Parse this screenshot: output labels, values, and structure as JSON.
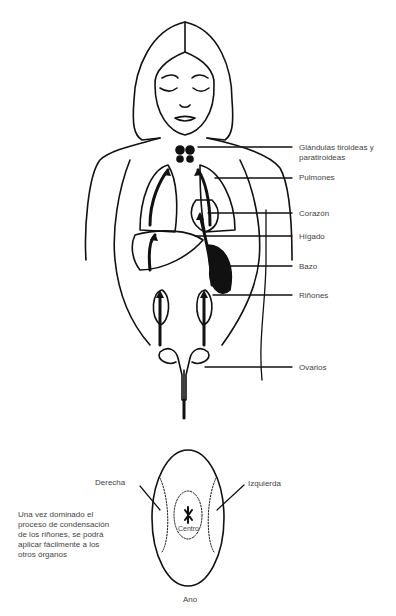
{
  "figure": {
    "organ_labels": [
      {
        "id": "tiroides",
        "text": "Glándulas tiroideas y",
        "text2": "paratiroideas"
      },
      {
        "id": "pulmones",
        "text": "Pulmones"
      },
      {
        "id": "corazon",
        "text": "Corazón"
      },
      {
        "id": "higado",
        "text": "Hígado"
      },
      {
        "id": "bazo",
        "text": "Bazo"
      },
      {
        "id": "rinones",
        "text": "Riñones"
      },
      {
        "id": "ovarios",
        "text": "Ovarios"
      }
    ],
    "perineum": {
      "right": "Derecha",
      "left": "Izquierda",
      "center": "Centro",
      "bottom": "Ano"
    },
    "note": "Una vez dominado el proceso de condensación de los riñones, se podrá aplicar fácilmente a los otros órganos",
    "line_color": "#111111",
    "text_color": "#444444"
  }
}
